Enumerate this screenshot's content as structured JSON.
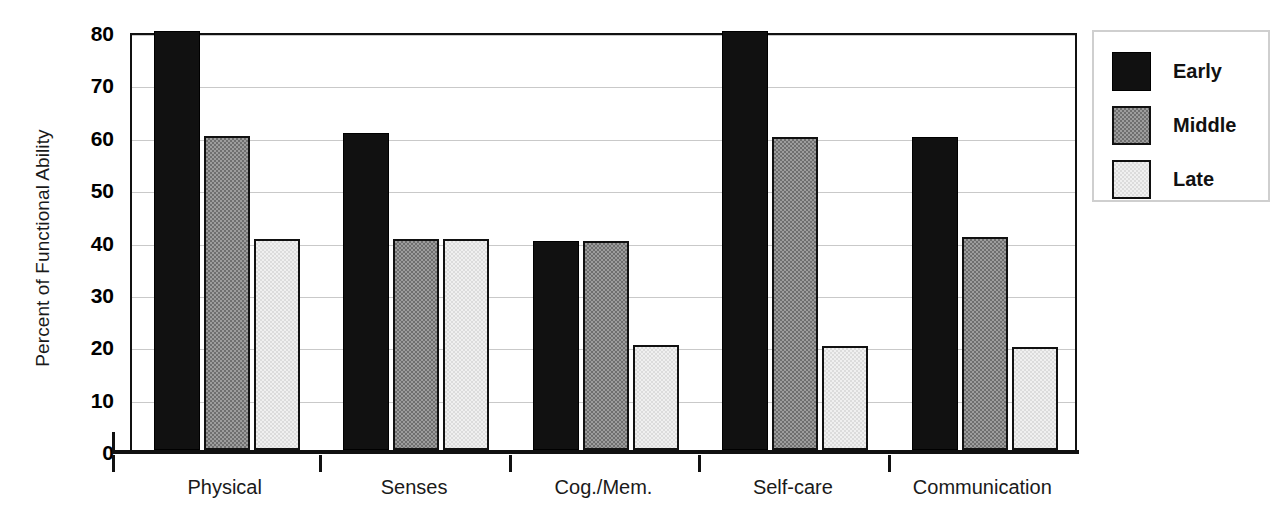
{
  "chart_data": {
    "type": "bar",
    "title": "",
    "xlabel": "",
    "ylabel": "Percent of Functional Ability",
    "ylim": [
      0,
      80
    ],
    "yticks": [
      0,
      10,
      20,
      30,
      40,
      50,
      60,
      70,
      80
    ],
    "ytick_labels": [
      "0",
      "10",
      "20",
      "30",
      "40",
      "50",
      "60",
      "70",
      "80"
    ],
    "grid": true,
    "legend_position": "right",
    "categories": [
      "Physical",
      "Senses",
      "Cog./Mem.",
      "Self-care",
      "Communication"
    ],
    "series": [
      {
        "name": "Early",
        "color": "#111111",
        "values": [
          80,
          60.5,
          40,
          80,
          59.8
        ]
      },
      {
        "name": "Middle",
        "color": "#9d9d9d",
        "values": [
          60,
          40.3,
          40,
          59.7,
          40.6
        ]
      },
      {
        "name": "Late",
        "color": "#f0f0f0",
        "values": [
          40.2,
          40.2,
          20,
          19.8,
          19.6
        ]
      }
    ]
  },
  "legend": {
    "entries": [
      {
        "label": "Early"
      },
      {
        "label": "Middle"
      },
      {
        "label": "Late"
      }
    ]
  }
}
